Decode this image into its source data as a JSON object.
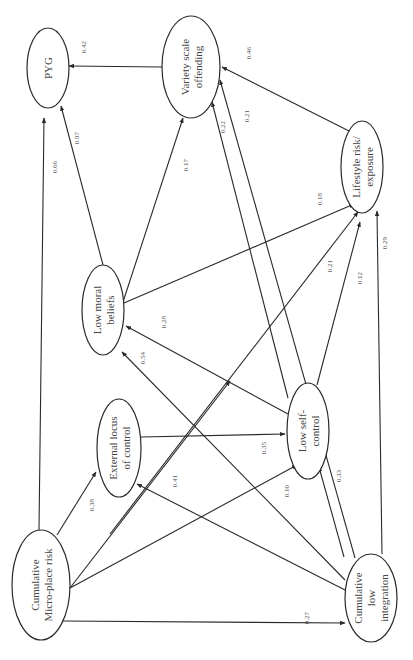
{
  "colors": {
    "line": "#2a2a2a",
    "text": "#444444",
    "coef_text": "#555555",
    "background": "#ffffff"
  },
  "orientation": "rotated-90-ccw",
  "nodes": {
    "pyg": {
      "lines": [
        "PYG"
      ],
      "cx": 48,
      "cy": 68,
      "rx": 21,
      "ry": 40
    },
    "variety": {
      "lines": [
        "Variety scale",
        "offending"
      ],
      "cx": 191,
      "cy": 67,
      "rx": 29,
      "ry": 51
    },
    "lifestyle": {
      "lines": [
        "Lifestyle risk/",
        "exposure"
      ],
      "cx": 362,
      "cy": 167,
      "rx": 21,
      "ry": 46
    },
    "moral": {
      "lines": [
        "Low moral",
        "beliefs"
      ],
      "cx": 103,
      "cy": 310,
      "rx": 21,
      "ry": 45
    },
    "locus": {
      "lines": [
        "External locus",
        "of control"
      ],
      "cx": 119,
      "cy": 448,
      "rx": 22,
      "ry": 49
    },
    "selfcontrol": {
      "lines": [
        "Low self-",
        "control"
      ],
      "cx": 308,
      "cy": 431,
      "rx": 21,
      "ry": 48
    },
    "microplace": {
      "lines": [
        "Cumulative",
        "Micro-place risk"
      ],
      "cx": 41,
      "cy": 585,
      "rx": 29,
      "ry": 55
    },
    "integration": {
      "lines": [
        "Cumulative",
        "low",
        "integration"
      ],
      "cx": 371,
      "cy": 598,
      "rx": 26,
      "ry": 44
    }
  },
  "edges": [
    {
      "from": "variety",
      "to": "pyg",
      "coef": "0.42",
      "x1": 162,
      "y1": 67,
      "x2": 69,
      "y2": 66,
      "lx": 86,
      "ly": 47
    },
    {
      "from": "lifestyle",
      "to": "variety",
      "coef": "0.46",
      "x1": 349,
      "y1": 131,
      "x2": 222,
      "y2": 67,
      "lx": 251,
      "ly": 53
    },
    {
      "from": "microplace",
      "to": "pyg",
      "coef": "0.66",
      "x1": 39,
      "y1": 530,
      "x2": 44,
      "y2": 118,
      "lx": 57,
      "ly": 167
    },
    {
      "from": "moral",
      "to": "pyg",
      "coef": "0.97",
      "x1": 103,
      "y1": 265,
      "x2": 61,
      "y2": 106,
      "lx": 79,
      "ly": 138
    },
    {
      "from": "moral",
      "to": "variety",
      "coef": "0.17",
      "x1": 123,
      "y1": 302,
      "x2": 183,
      "y2": 118,
      "lx": 188,
      "ly": 165
    },
    {
      "from": "selfcontrol",
      "to": "variety",
      "coef": "0.22",
      "x1": 288,
      "y1": 398,
      "x2": 212,
      "y2": 102,
      "lx": 225,
      "ly": 127
    },
    {
      "from": "integration",
      "to": "variety",
      "coef": "0.21",
      "x1": 355,
      "y1": 558,
      "x2": 220,
      "y2": 80,
      "lx": 249,
      "ly": 116
    },
    {
      "from": "moral",
      "to": "lifestyle",
      "coef": "0.18",
      "x1": 124,
      "y1": 303,
      "x2": 354,
      "y2": 204,
      "lx": 322,
      "ly": 199
    },
    {
      "from": "microplace",
      "to": "lifestyle",
      "coef": "0.21",
      "x1": 110,
      "y1": 534,
      "x2": 358,
      "y2": 212,
      "lx": 332,
      "ly": 266
    },
    {
      "from": "selfcontrol",
      "to": "lifestyle",
      "coef": "0.12",
      "x1": 317,
      "y1": 385,
      "x2": 360,
      "y2": 222,
      "lx": 362,
      "ly": 278
    },
    {
      "from": "integration",
      "to": "lifestyle",
      "coef": "0.29",
      "x1": 382,
      "y1": 554,
      "x2": 377,
      "y2": 211,
      "lx": 387,
      "ly": 243
    },
    {
      "from": "selfcontrol",
      "to": "moral",
      "coef": "0.28",
      "x1": 288,
      "y1": 414,
      "x2": 126,
      "y2": 326,
      "lx": 166,
      "ly": 322
    },
    {
      "from": "integration",
      "to": "moral",
      "coef": "0.54",
      "x1": 345,
      "y1": 580,
      "x2": 122,
      "y2": 352,
      "lx": 145,
      "ly": 358
    },
    {
      "from": "locus",
      "to": "selfcontrol",
      "coef": "0.35",
      "x1": 141,
      "y1": 437,
      "x2": 285,
      "y2": 434,
      "lx": 266,
      "ly": 448
    },
    {
      "from": "microplace",
      "to": "locus",
      "coef": "0.38",
      "x1": 57,
      "y1": 535,
      "x2": 96,
      "y2": 472,
      "lx": 94,
      "ly": 505
    },
    {
      "from": "microplace",
      "to": "moral",
      "coef": "0.41",
      "x1": 70,
      "y1": 588,
      "x2": 230,
      "y2": 381,
      "lx": 177,
      "ly": 481
    },
    {
      "from": "microplace",
      "to": "selfcontrol",
      "coef": "0.10",
      "x1": 70,
      "y1": 588,
      "x2": 297,
      "y2": 465,
      "lx": 289,
      "ly": 491
    },
    {
      "from": "integration",
      "to": "locus",
      "coef": "",
      "x1": 345,
      "y1": 590,
      "x2": 137,
      "y2": 484,
      "lx": 0,
      "ly": 0
    },
    {
      "from": "integration",
      "to": "selfcontrol",
      "coef": "0.33",
      "x1": 344,
      "y1": 557,
      "x2": 319,
      "y2": 467,
      "lx": 341,
      "ly": 476
    },
    {
      "from": "microplace",
      "to": "integration",
      "coef": "0.27",
      "x1": 62,
      "y1": 621,
      "x2": 345,
      "y2": 623,
      "lx": 309,
      "ly": 618
    }
  ],
  "chart_data": {
    "type": "path-diagram",
    "title": "",
    "nodes": [
      "PYG",
      "Variety scale offending",
      "Lifestyle risk/exposure",
      "Low moral beliefs",
      "External locus of control",
      "Low self-control",
      "Cumulative Micro-place risk",
      "Cumulative low integration"
    ],
    "paths": [
      {
        "from": "Variety scale offending",
        "to": "PYG",
        "coefficient": 0.42
      },
      {
        "from": "Lifestyle risk/exposure",
        "to": "Variety scale offending",
        "coefficient": 0.46
      },
      {
        "from": "Cumulative Micro-place risk",
        "to": "PYG",
        "coefficient": 0.66
      },
      {
        "from": "Low moral beliefs",
        "to": "PYG",
        "coefficient": 0.97
      },
      {
        "from": "Low moral beliefs",
        "to": "Variety scale offending",
        "coefficient": 0.17
      },
      {
        "from": "Low self-control",
        "to": "Variety scale offending",
        "coefficient": 0.22
      },
      {
        "from": "Cumulative low integration",
        "to": "Variety scale offending",
        "coefficient": 0.21
      },
      {
        "from": "Low moral beliefs",
        "to": "Lifestyle risk/exposure",
        "coefficient": 0.18
      },
      {
        "from": "Cumulative Micro-place risk",
        "to": "Lifestyle risk/exposure",
        "coefficient": 0.21
      },
      {
        "from": "Low self-control",
        "to": "Lifestyle risk/exposure",
        "coefficient": 0.12
      },
      {
        "from": "Cumulative low integration",
        "to": "Lifestyle risk/exposure",
        "coefficient": 0.29
      },
      {
        "from": "Low self-control",
        "to": "Low moral beliefs",
        "coefficient": 0.28
      },
      {
        "from": "Cumulative low integration",
        "to": "Low moral beliefs",
        "coefficient": 0.54
      },
      {
        "from": "External locus of control",
        "to": "Low self-control",
        "coefficient": 0.35
      },
      {
        "from": "Cumulative Micro-place risk",
        "to": "External locus of control",
        "coefficient": 0.38
      },
      {
        "from": "Cumulative Micro-place risk",
        "to": "Low moral beliefs",
        "coefficient": 0.41
      },
      {
        "from": "Cumulative Micro-place risk",
        "to": "Low self-control",
        "coefficient": 0.1
      },
      {
        "from": "Cumulative low integration",
        "to": "External locus of control",
        "coefficient": null
      },
      {
        "from": "Cumulative low integration",
        "to": "Low self-control",
        "coefficient": 0.33
      },
      {
        "from": "Cumulative Micro-place risk",
        "to": "Cumulative low integration",
        "coefficient": 0.27
      }
    ]
  }
}
